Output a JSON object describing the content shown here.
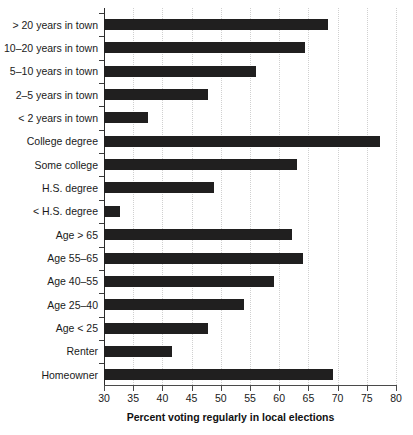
{
  "chart_data": {
    "type": "bar",
    "orientation": "horizontal",
    "title": "",
    "xlabel": "Percent voting regularly in local elections",
    "ylabel": "",
    "xlim": [
      30,
      80
    ],
    "xticks": [
      30,
      35,
      40,
      45,
      50,
      55,
      60,
      65,
      70,
      75,
      80
    ],
    "grid": "vertical-dotted",
    "legend": "none",
    "bar_color": "#201f1f",
    "categories": [
      "> 20 years in town",
      "10–20 years in town",
      "5–10 years in town",
      "2–5 years in town",
      "< 2 years in town",
      "College degree",
      "Some college",
      "H.S. degree",
      "< H.S. degree",
      "Age > 65",
      "Age 55–65",
      "Age 40–55",
      "Age 25–40",
      "Age < 25",
      "Renter",
      "Homeowner"
    ],
    "values": [
      68.4,
      64.4,
      56.0,
      47.8,
      37.5,
      77.3,
      63.0,
      48.8,
      32.7,
      62.2,
      64.0,
      59.1,
      54.0,
      47.8,
      41.6,
      69.2
    ]
  }
}
